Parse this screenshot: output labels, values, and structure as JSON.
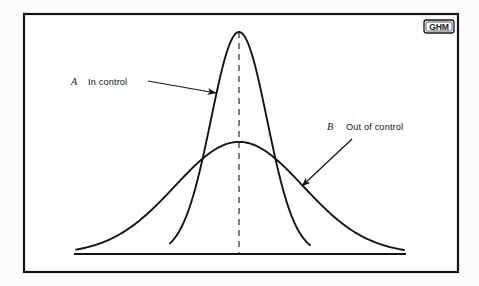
{
  "figure": {
    "background_color": "#fcfcfb",
    "ink_color": "#141414",
    "frame": {
      "name": "figure-border",
      "x": 24,
      "y": 14,
      "width": 434,
      "height": 258,
      "stroke_width": 2.2
    },
    "logo": {
      "text": "GHM",
      "x": 424,
      "y": 20,
      "width": 30,
      "height": 13
    }
  },
  "chart_data": {
    "type": "line",
    "title": "",
    "subtitle": "",
    "xlabel": "",
    "ylabel": "",
    "grid": false,
    "legend_position": "inline-annotations",
    "axis": {
      "baseline_y": 254,
      "baseline_x_start": 74,
      "baseline_x_end": 406,
      "center_x": 239,
      "peak_top_y": 32,
      "xlim": [
        74,
        406
      ],
      "ylim": [
        0,
        1
      ]
    },
    "center_line": {
      "name": "process-mean-line",
      "style": "dashed",
      "x": 239,
      "y_top": 32,
      "y_bottom": 254,
      "dash": "6 5"
    },
    "series": [
      {
        "key": "A",
        "letter": "A",
        "name": "In control",
        "description": "Narrow tall normal distribution centered on the process mean",
        "peak_y": 32,
        "peak_height_fraction": 1.0,
        "sigma_px": 28,
        "baseline_left_x": 170,
        "baseline_right_x": 310,
        "stroke_width": 1.9
      },
      {
        "key": "B",
        "letter": "B",
        "name": "Out of control",
        "description": "Wide low normal distribution centered on the process mean",
        "peak_y": 142,
        "peak_height_fraction": 0.505,
        "sigma_px": 64,
        "baseline_left_x": 76,
        "baseline_right_x": 404,
        "stroke_width": 1.9
      }
    ],
    "annotations": [
      {
        "key": "A",
        "letter": "A",
        "label": "In control",
        "letter_x": 71,
        "letter_y": 85,
        "label_x": 88,
        "label_y": 85,
        "leader_from": [
          148,
          81
        ],
        "leader_to": [
          216,
          93
        ]
      },
      {
        "key": "B",
        "letter": "B",
        "label": "Out of control",
        "letter_x": 327,
        "letter_y": 130,
        "label_x": 346,
        "label_y": 130,
        "leader_from": [
          352,
          139
        ],
        "leader_to": [
          302,
          186
        ]
      }
    ]
  }
}
